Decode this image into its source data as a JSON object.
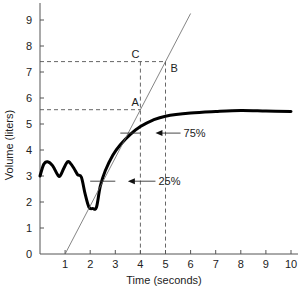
{
  "chart_data": {
    "type": "line",
    "title": "",
    "xlabel": "Time (seconds)",
    "ylabel": "Volume (liters)",
    "xlim": [
      0,
      10
    ],
    "ylim": [
      0,
      9.5
    ],
    "grid": false,
    "x_ticks": [
      "1",
      "2",
      "3",
      "4",
      "5",
      "6",
      "7",
      "8",
      "9",
      "10"
    ],
    "y_ticks": [
      "0",
      "1",
      "2",
      "3",
      "4",
      "5",
      "6",
      "7",
      "8",
      "9"
    ],
    "series": [
      {
        "name": "Volume curve",
        "style": "thick solid black",
        "x": [
          0.0,
          0.15,
          0.3,
          0.5,
          0.7,
          0.8,
          0.95,
          1.1,
          1.2,
          1.35,
          1.5,
          1.65,
          1.8,
          1.95,
          2.1,
          2.25,
          2.4,
          2.6,
          2.9,
          3.2,
          3.6,
          4.0,
          4.5,
          5.0,
          6.0,
          7.0,
          8.0,
          9.0,
          10.0
        ],
        "y": [
          3.0,
          3.45,
          3.55,
          3.4,
          3.05,
          3.0,
          3.3,
          3.55,
          3.5,
          3.3,
          3.05,
          2.95,
          2.3,
          1.8,
          1.75,
          1.8,
          2.6,
          3.2,
          3.8,
          4.2,
          4.6,
          4.9,
          5.15,
          5.3,
          5.42,
          5.48,
          5.52,
          5.5,
          5.48
        ]
      },
      {
        "name": "Tangent line",
        "style": "thin solid",
        "x": [
          1.0,
          6.0
        ],
        "y": [
          0.0,
          9.25
        ]
      }
    ],
    "reference_lines": [
      {
        "type": "horizontal",
        "style": "dashed",
        "y": 7.4,
        "x_range": [
          0,
          5
        ]
      },
      {
        "type": "horizontal",
        "style": "dashed",
        "y": 5.55,
        "x_range": [
          0,
          4
        ]
      },
      {
        "type": "vertical",
        "style": "dashed",
        "x": 4,
        "y_range": [
          0,
          7.4
        ]
      },
      {
        "type": "vertical",
        "style": "dashed",
        "x": 5,
        "y_range": [
          0,
          7.4
        ]
      }
    ],
    "annotations": [
      {
        "label": "A",
        "x": 4.0,
        "y": 5.55
      },
      {
        "label": "B",
        "x": 5.0,
        "y": 7.4
      },
      {
        "label": "C",
        "x": 4.0,
        "y": 7.4
      },
      {
        "label": "75%",
        "y": 4.65,
        "marker_x_range": [
          3.2,
          4.0
        ],
        "arrow_from_x": 5.6,
        "arrow_to_x": 4.6
      },
      {
        "label": "25%",
        "y": 2.8,
        "marker_x_range": [
          2.0,
          3.0
        ],
        "arrow_from_x": 4.6,
        "arrow_to_x": 3.5
      }
    ]
  },
  "labels": {
    "xlabel": "Time (seconds)",
    "ylabel": "Volume (liters)",
    "point_a": "A",
    "point_b": "B",
    "point_c": "C",
    "pct_75": "75%",
    "pct_25": "25%"
  }
}
